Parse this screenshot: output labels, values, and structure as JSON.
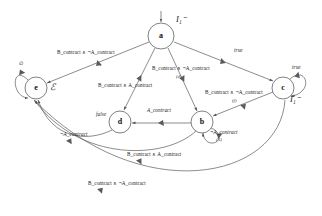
{
  "diagram": {
    "type": "state-transition-diagram",
    "nodes": [
      {
        "id": "a",
        "label": "a",
        "cx": 161,
        "cy": 36,
        "r": 13,
        "state_label": "I₁⁻",
        "state_label_x": 176,
        "state_label_y": 18
      },
      {
        "id": "e",
        "label": "e",
        "cx": 36,
        "cy": 88,
        "r": 11,
        "state_label": "ℰ",
        "state_label_x": 50,
        "state_label_y": 84
      },
      {
        "id": "c",
        "label": "c",
        "cx": 283,
        "cy": 88,
        "r": 11,
        "state_label": "I₁⁻",
        "state_label_x": 291,
        "state_label_y": 97
      },
      {
        "id": "d",
        "label": "d",
        "cx": 120,
        "cy": 122,
        "r": 11,
        "state_label": "false",
        "state_label_x": 96,
        "state_label_y": 113
      },
      {
        "id": "b",
        "label": "b",
        "cx": 202,
        "cy": 122,
        "r": 11,
        "state_label": "",
        "state_label_x": 0,
        "state_label_y": 0
      }
    ],
    "edge_labels": [
      {
        "id": "a-to-e",
        "text": "B_contract ∧ ¬A_contract",
        "x": 57,
        "y": 54
      },
      {
        "id": "a-to-d",
        "text": "B_contract ∧ A_contract",
        "x": 98,
        "y": 87
      },
      {
        "id": "a-to-b",
        "text": "B_contract ∧ ¬A_contract",
        "x": 152,
        "y": 70
      },
      {
        "id": "a-to-b-tag",
        "text": "(d)",
        "x": 176,
        "y": 79
      },
      {
        "id": "a-to-c",
        "text": "true",
        "x": 234,
        "y": 51
      },
      {
        "id": "c-self",
        "text": "true",
        "x": 292,
        "y": 68
      },
      {
        "id": "c-to-b",
        "text": "B_contract ∧ ¬A_contract",
        "x": 205,
        "y": 94
      },
      {
        "id": "c-to-b-tag",
        "text": "(f)",
        "x": 232,
        "y": 103
      },
      {
        "id": "b-to-d",
        "text": "A_contract",
        "x": 147,
        "y": 111
      },
      {
        "id": "b-self",
        "text": "¬A_contract",
        "x": 210,
        "y": 133
      },
      {
        "id": "b-self-tag",
        "text": "(A)",
        "x": 216,
        "y": 141
      },
      {
        "id": "d-to-e",
        "text": "¬A_contract",
        "x": 60,
        "y": 135
      },
      {
        "id": "b-to-e",
        "text": "B_contract ∧ A_contract",
        "x": 127,
        "y": 155
      },
      {
        "id": "c-to-e",
        "text": "B_contract ∧ ¬A_contract",
        "x": 88,
        "y": 184
      },
      {
        "id": "e-self",
        "text": "∅",
        "x": 19,
        "y": 64
      }
    ],
    "colors": {
      "stroke": "#5a5a5a",
      "node_stroke": "#4a4a4a",
      "text": "#1a1a1a",
      "background": "#ffffff"
    }
  }
}
